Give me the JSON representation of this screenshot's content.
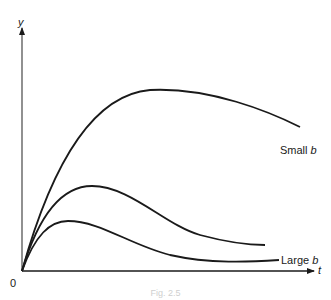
{
  "figure": {
    "y_axis_label": "y",
    "x_axis_label": "t",
    "origin_label": "0",
    "caption": "Fig. 2.5",
    "colors": {
      "stroke": "#1a1a1a",
      "background": "#ffffff"
    }
  },
  "curves": [
    {
      "name": "Small b",
      "label_text": "Small ",
      "label_var": "b"
    },
    {
      "name": "Intermediate b",
      "label_text": "",
      "label_var": ""
    },
    {
      "name": "Large b",
      "label_text": "Large ",
      "label_var": "b"
    }
  ]
}
